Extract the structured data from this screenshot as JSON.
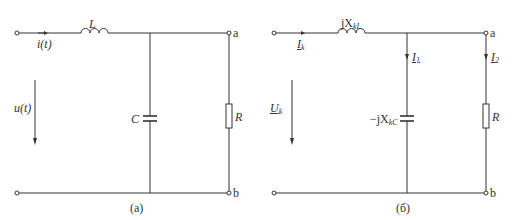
{
  "circuits": [
    {
      "caption": "(a)",
      "inductor_label": "L",
      "current_label": "i(t)",
      "voltage_label": "u(t)",
      "capacitor_label": "C",
      "resistor_label": "R",
      "terminal_top": "a",
      "terminal_bottom": "b"
    },
    {
      "caption": "(б)",
      "inductor_label_main": "jX",
      "inductor_label_sub": "kL",
      "current_label_main": "I",
      "current_label_sub": "k",
      "voltage_label_main": "U",
      "voltage_label_sub": "k",
      "branch1_current_main": "I",
      "branch1_current_sub": "1",
      "branch2_current_main": "I",
      "branch2_current_sub": "2",
      "capacitor_label_main": "−jX",
      "capacitor_label_sub": "kC",
      "resistor_label": "R",
      "terminal_top": "a",
      "terminal_bottom": "b"
    }
  ]
}
